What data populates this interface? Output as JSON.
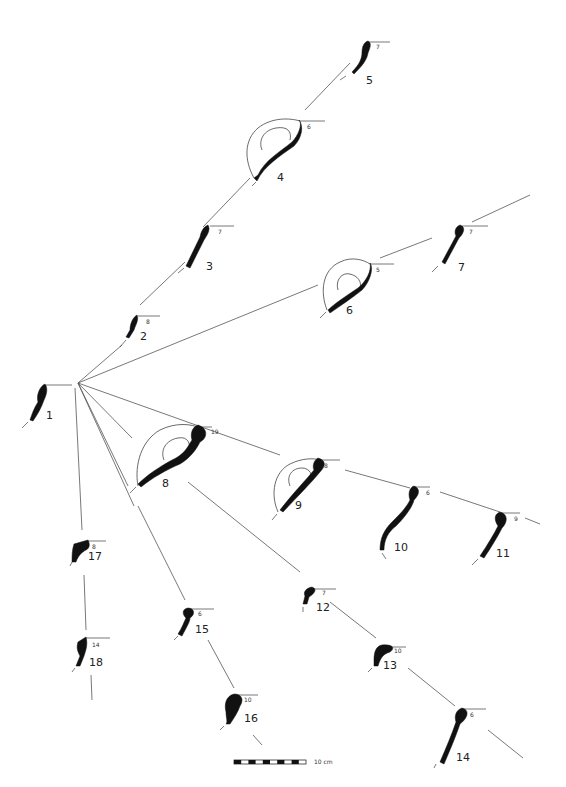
{
  "figure": {
    "type": "typological seriation diagram of vessel rim profiles",
    "scale_bar": {
      "label": "10 cm",
      "segments": 10
    }
  },
  "profiles": [
    {
      "id": "1",
      "label": "1",
      "diameter": ""
    },
    {
      "id": "2",
      "label": "2",
      "diameter": "8"
    },
    {
      "id": "3",
      "label": "3",
      "diameter": "7"
    },
    {
      "id": "4",
      "label": "4",
      "diameter": "6"
    },
    {
      "id": "5",
      "label": "5",
      "diameter": "7"
    },
    {
      "id": "6",
      "label": "6",
      "diameter": "5"
    },
    {
      "id": "7",
      "label": "7",
      "diameter": "7"
    },
    {
      "id": "8",
      "label": "8",
      "diameter": "19"
    },
    {
      "id": "9",
      "label": "9",
      "diameter": "8"
    },
    {
      "id": "10",
      "label": "10",
      "diameter": "6"
    },
    {
      "id": "11",
      "label": "11",
      "diameter": "9"
    },
    {
      "id": "12",
      "label": "12",
      "diameter": "7"
    },
    {
      "id": "13",
      "label": "13",
      "diameter": "10"
    },
    {
      "id": "14",
      "label": "14",
      "diameter": "6"
    },
    {
      "id": "15",
      "label": "15",
      "diameter": "6"
    },
    {
      "id": "16",
      "label": "16",
      "diameter": "10"
    },
    {
      "id": "17",
      "label": "17",
      "diameter": "8"
    },
    {
      "id": "18",
      "label": "18",
      "diameter": "14"
    }
  ],
  "links": [
    [
      "1",
      "2"
    ],
    [
      "2",
      "3"
    ],
    [
      "3",
      "4"
    ],
    [
      "4",
      "5"
    ],
    [
      "1",
      "6"
    ],
    [
      "6",
      "7"
    ],
    [
      "1",
      "8"
    ],
    [
      "8",
      "9"
    ],
    [
      "9",
      "10"
    ],
    [
      "10",
      "11"
    ],
    [
      "8",
      "12"
    ],
    [
      "12",
      "13"
    ],
    [
      "13",
      "14"
    ],
    [
      "1",
      "15"
    ],
    [
      "15",
      "16"
    ],
    [
      "1",
      "17"
    ],
    [
      "17",
      "18"
    ]
  ]
}
